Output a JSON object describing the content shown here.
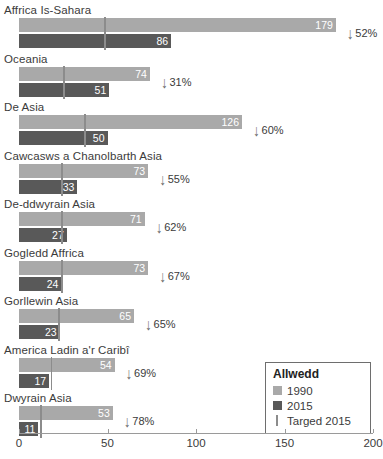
{
  "chart_data": {
    "type": "bar",
    "orientation": "horizontal",
    "title": "",
    "xlabel": "",
    "ylabel": "",
    "xlim": [
      0,
      200
    ],
    "xticks": [
      0,
      50,
      100,
      150,
      200
    ],
    "grid": false,
    "categories": [
      "Affrica Is-Sahara",
      "Oceania",
      "De Asia",
      "Cawcasws a Chanolbarth Asia",
      "De-ddwyrain Asia",
      "Gogledd Affrica",
      "Gorllewin Asia",
      "America Ladin a'r Caribî",
      "Dwyrain Asia"
    ],
    "series": [
      {
        "name": "1990",
        "color": "#a9a9a9",
        "values": [
          179,
          74,
          126,
          73,
          71,
          73,
          65,
          54,
          53
        ]
      },
      {
        "name": "2015",
        "color": "#595959",
        "values": [
          86,
          51,
          50,
          33,
          27,
          24,
          23,
          17,
          11
        ]
      },
      {
        "name": "Targed 2015",
        "color": "#8c8c8c",
        "values": [
          48,
          25,
          37,
          24,
          24,
          24,
          22,
          18,
          12
        ]
      }
    ],
    "change_labels": [
      "52%",
      "31%",
      "60%",
      "55%",
      "62%",
      "67%",
      "65%",
      "69%",
      "78%"
    ],
    "change_direction": "down",
    "legend": {
      "position": "bottom-right",
      "title": "Allwedd",
      "entries": [
        {
          "label": "1990",
          "marker": "square",
          "color": "#a9a9a9"
        },
        {
          "label": "2015",
          "marker": "square",
          "color": "#595959"
        },
        {
          "label": "Targed 2015",
          "marker": "tick",
          "color": "#8c8c8c"
        }
      ]
    },
    "rows": [
      {
        "label": "Affrica Is-Sahara",
        "v1990": 179,
        "v2015": 86,
        "target": 48,
        "change": "52%",
        "arrow": "↓"
      },
      {
        "label": "Oceania",
        "v1990": 74,
        "v2015": 51,
        "target": 25,
        "change": "31%",
        "arrow": "↓"
      },
      {
        "label": "De Asia",
        "v1990": 126,
        "v2015": 50,
        "target": 37,
        "change": "60%",
        "arrow": "↓"
      },
      {
        "label": "Cawcasws a Chanolbarth Asia",
        "v1990": 73,
        "v2015": 33,
        "target": 24,
        "change": "55%",
        "arrow": "↓"
      },
      {
        "label": "De-ddwyrain Asia",
        "v1990": 71,
        "v2015": 27,
        "target": 24,
        "change": "62%",
        "arrow": "↓"
      },
      {
        "label": "Gogledd Affrica",
        "v1990": 73,
        "v2015": 24,
        "target": 24,
        "change": "67%",
        "arrow": "↓"
      },
      {
        "label": "Gorllewin Asia",
        "v1990": 65,
        "v2015": 23,
        "target": 22,
        "change": "65%",
        "arrow": "↓"
      },
      {
        "label": "America Ladin a'r Caribî",
        "v1990": 54,
        "v2015": 17,
        "target": 18,
        "change": "69%",
        "arrow": "↓"
      },
      {
        "label": "Dwyrain Asia",
        "v1990": 53,
        "v2015": 11,
        "target": 12,
        "change": "78%",
        "arrow": "↓"
      }
    ]
  },
  "axis": {
    "ticks": [
      "0",
      "50",
      "100",
      "150",
      "200"
    ]
  },
  "legend": {
    "title": "Allwedd",
    "item_1990": "1990",
    "item_2015": "2015",
    "item_target": "Targed 2015"
  }
}
